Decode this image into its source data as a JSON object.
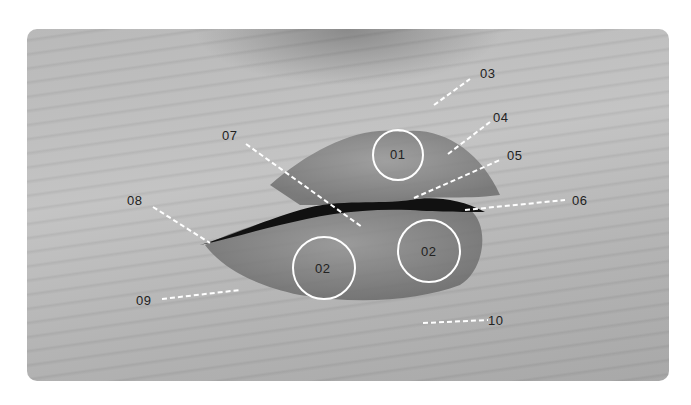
{
  "figure": {
    "circle_labels": [
      {
        "id": "01",
        "cx": 398,
        "cy": 155,
        "r": 25
      },
      {
        "id": "02",
        "cx": 324,
        "cy": 268,
        "r": 31
      },
      {
        "id": "02",
        "cx": 429,
        "cy": 251,
        "r": 31
      }
    ],
    "callouts": [
      {
        "id": "03",
        "label_x": 480,
        "label_y": 66,
        "line": [
          434,
          105,
          470,
          79
        ]
      },
      {
        "id": "04",
        "label_x": 493,
        "label_y": 110,
        "line": [
          448,
          154,
          490,
          122
        ]
      },
      {
        "id": "05",
        "label_x": 507,
        "label_y": 148,
        "line": [
          414,
          198,
          500,
          160
        ]
      },
      {
        "id": "06",
        "label_x": 572,
        "label_y": 193,
        "line": [
          465,
          210,
          565,
          200
        ]
      },
      {
        "id": "07",
        "label_x": 222,
        "label_y": 128,
        "line": [
          246,
          144,
          362,
          227
        ]
      },
      {
        "id": "08",
        "label_x": 127,
        "label_y": 193,
        "line": [
          153,
          207,
          210,
          243
        ]
      },
      {
        "id": "09",
        "label_x": 136,
        "label_y": 293,
        "line": [
          162,
          299,
          240,
          290
        ]
      },
      {
        "id": "10",
        "label_x": 488,
        "label_y": 313,
        "line": [
          423,
          323,
          488,
          320
        ]
      }
    ]
  }
}
